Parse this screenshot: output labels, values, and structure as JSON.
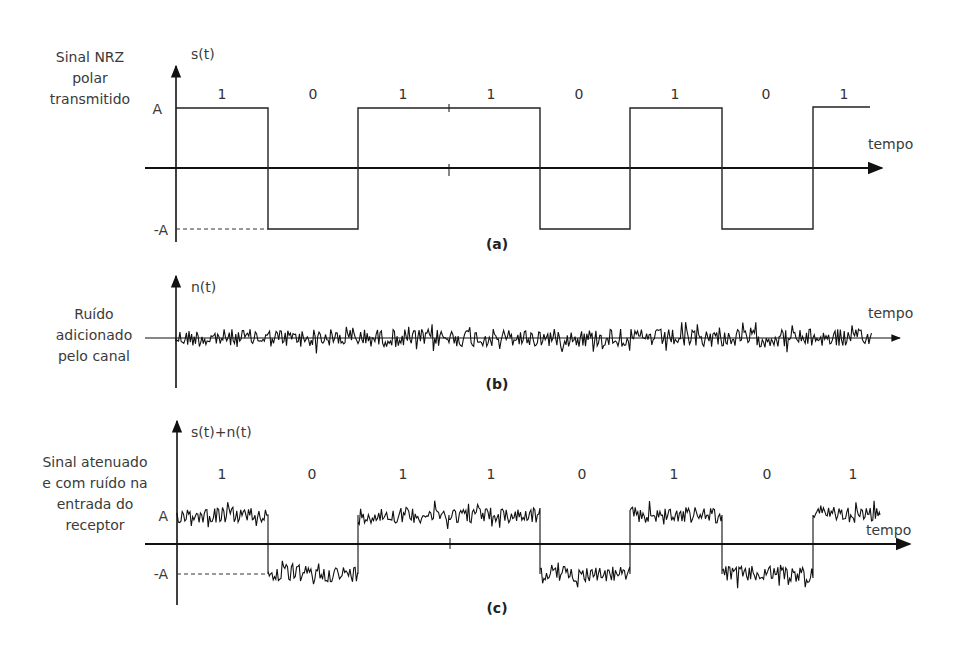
{
  "panels": {
    "a": {
      "caption": "(a)",
      "side_label": [
        "Sinal NRZ",
        "polar",
        "transmitido"
      ],
      "y_axis_label": "s(t)",
      "x_axis_label": "tempo",
      "level_high": "A",
      "level_low": "-A",
      "bits": [
        "1",
        "0",
        "1",
        "1",
        "0",
        "1",
        "0",
        "1"
      ]
    },
    "b": {
      "caption": "(b)",
      "side_label": [
        "Ruído",
        "adicionado",
        "pelo canal"
      ],
      "y_axis_label": "n(t)",
      "x_axis_label": "tempo"
    },
    "c": {
      "caption": "(c)",
      "side_label": [
        "Sinal atenuado",
        "e com ruído na",
        "entrada do",
        "receptor"
      ],
      "y_axis_label": "s(t)+n(t)",
      "x_axis_label": "tempo",
      "level_high": "A",
      "level_low": "-A",
      "bits": [
        "1",
        "0",
        "1",
        "1",
        "0",
        "1",
        "0",
        "1"
      ]
    }
  },
  "chart_data": [
    {
      "type": "line",
      "title": "Sinal NRZ polar transmitido",
      "panel": "(a)",
      "xlabel": "tempo",
      "ylabel": "s(t)",
      "bits": [
        1,
        0,
        1,
        1,
        0,
        1,
        0,
        1
      ],
      "levels": {
        "1": "A",
        "0": "-A"
      },
      "values": [
        "A",
        "-A",
        "A",
        "A",
        "-A",
        "A",
        "-A",
        "A"
      ]
    },
    {
      "type": "line",
      "title": "Ruído adicionado pelo canal",
      "panel": "(b)",
      "xlabel": "tempo",
      "ylabel": "n(t)",
      "description": "zero-mean random noise"
    },
    {
      "type": "line",
      "title": "Sinal atenuado e com ruído na entrada do receptor",
      "panel": "(c)",
      "xlabel": "tempo",
      "ylabel": "s(t)+n(t)",
      "bits": [
        1,
        0,
        1,
        1,
        0,
        1,
        0,
        1
      ],
      "levels": {
        "1": "A",
        "0": "-A"
      },
      "values": [
        "A",
        "-A",
        "A",
        "A",
        "-A",
        "A",
        "-A",
        "A"
      ]
    }
  ]
}
